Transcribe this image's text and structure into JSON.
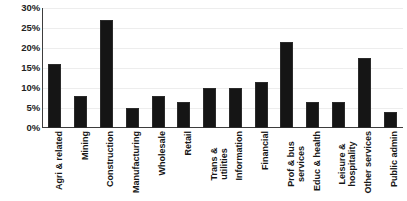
{
  "chart_data": {
    "type": "bar",
    "title": "",
    "xlabel": "",
    "ylabel": "",
    "ylim": [
      0,
      30
    ],
    "ytick_labels": [
      "30%",
      "25%",
      "20%",
      "15%",
      "10%",
      "5%",
      "0%"
    ],
    "ytick_values": [
      30,
      25,
      20,
      15,
      10,
      5,
      0
    ],
    "grid": true,
    "legend": "none",
    "bar_color": "#151515",
    "categories": [
      "Agri & related",
      "Mining",
      "Construction",
      "Manufacturing",
      "Wholesale",
      "Retail",
      "Trans & utilities",
      "Information",
      "Financial",
      "Prof & bus services",
      "Educ & health",
      "Leisure & hospitality",
      "Other services",
      "Public admin"
    ],
    "category_lines": [
      [
        "Agri & related"
      ],
      [
        "Mining"
      ],
      [
        "Construction"
      ],
      [
        "Manufacturing"
      ],
      [
        "Wholesale"
      ],
      [
        "Retail"
      ],
      [
        "Trans &",
        "utilities"
      ],
      [
        "Information"
      ],
      [
        "Financial"
      ],
      [
        "Prof & bus",
        "services"
      ],
      [
        "Educ & health"
      ],
      [
        "Leisure &",
        "hospitality"
      ],
      [
        "Other services"
      ],
      [
        "Public admin"
      ]
    ],
    "values": [
      16.0,
      8.0,
      27.0,
      5.0,
      8.0,
      6.5,
      10.0,
      10.0,
      11.5,
      21.5,
      6.5,
      6.5,
      17.5,
      4.0
    ]
  }
}
